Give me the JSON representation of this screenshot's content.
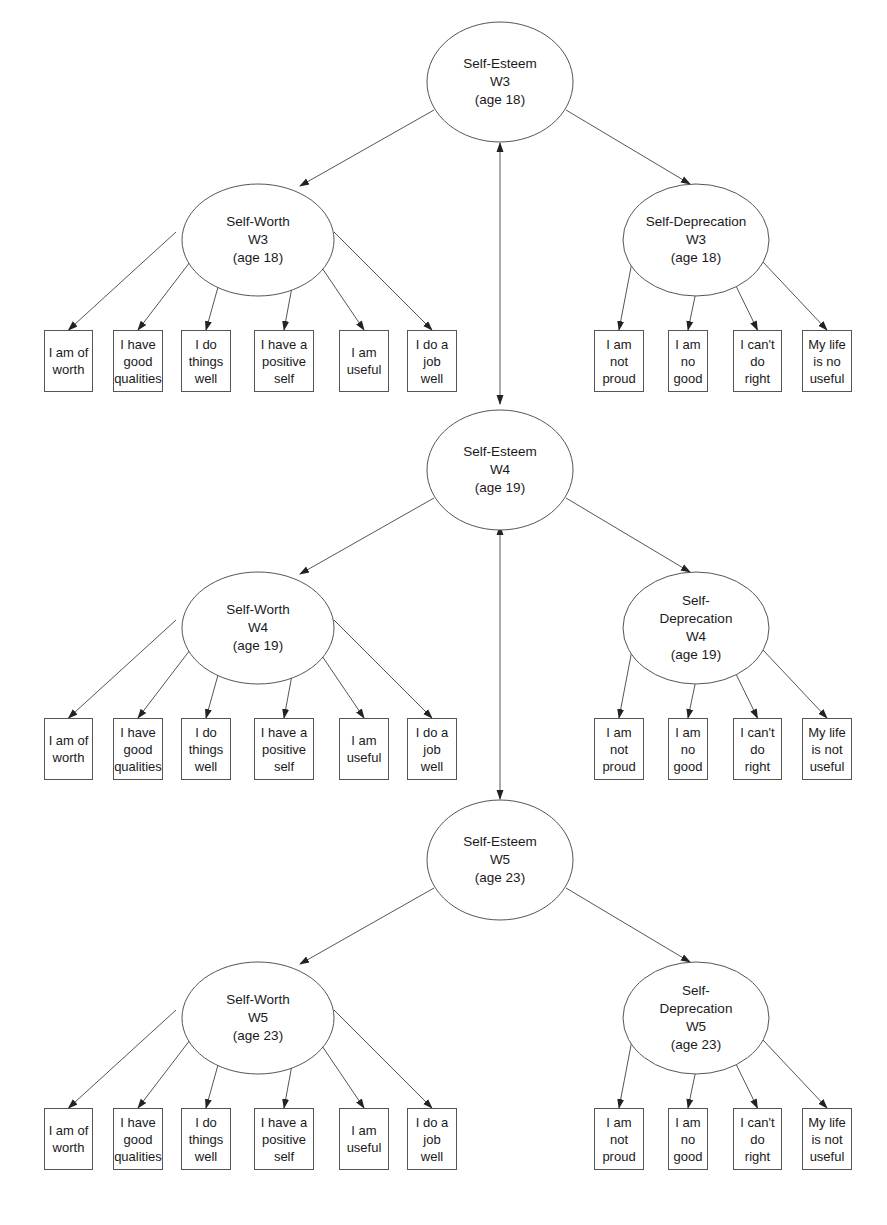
{
  "diagram": {
    "type": "structural-equation-model",
    "waves": [
      {
        "id": "W3",
        "self_esteem": {
          "lines": [
            "Self-Esteem",
            "W3",
            "(age 18)"
          ]
        },
        "self_worth": {
          "lines": [
            "Self-Worth",
            "W3",
            "(age 18)"
          ],
          "indicators": [
            {
              "lines": [
                "I am of",
                "worth"
              ]
            },
            {
              "lines": [
                "I have",
                "good",
                "qualities"
              ]
            },
            {
              "lines": [
                "I do",
                "things",
                "well"
              ]
            },
            {
              "lines": [
                "I have a",
                "positive",
                "self"
              ]
            },
            {
              "lines": [
                "I am",
                "useful"
              ]
            },
            {
              "lines": [
                "I do a",
                "job",
                "well"
              ]
            }
          ]
        },
        "self_deprecation": {
          "lines": [
            "Self-Deprecation",
            "W3",
            "(age 18)"
          ],
          "indicators": [
            {
              "lines": [
                "I am",
                "not",
                "proud"
              ]
            },
            {
              "lines": [
                "I am",
                "no",
                "good"
              ]
            },
            {
              "lines": [
                "I can't",
                "do",
                "right"
              ]
            },
            {
              "lines": [
                "My life",
                "is no",
                "useful"
              ]
            }
          ]
        }
      },
      {
        "id": "W4",
        "self_esteem": {
          "lines": [
            "Self-Esteem",
            "W4",
            "(age 19)"
          ]
        },
        "self_worth": {
          "lines": [
            "Self-Worth",
            "W4",
            "(age 19)"
          ],
          "indicators": [
            {
              "lines": [
                "I am of",
                "worth"
              ]
            },
            {
              "lines": [
                "I have",
                "good",
                "qualities"
              ]
            },
            {
              "lines": [
                "I do",
                "things",
                "well"
              ]
            },
            {
              "lines": [
                "I have a",
                "positive",
                "self"
              ]
            },
            {
              "lines": [
                "I am",
                "useful"
              ]
            },
            {
              "lines": [
                "I do a",
                "job",
                "well"
              ]
            }
          ]
        },
        "self_deprecation": {
          "lines": [
            "Self-",
            "Deprecation",
            "W4",
            "(age 19)"
          ],
          "indicators": [
            {
              "lines": [
                "I am",
                "not",
                "proud"
              ]
            },
            {
              "lines": [
                "I am",
                "no",
                "good"
              ]
            },
            {
              "lines": [
                "I can't",
                "do",
                "right"
              ]
            },
            {
              "lines": [
                "My life",
                "is not",
                "useful"
              ]
            }
          ]
        }
      },
      {
        "id": "W5",
        "self_esteem": {
          "lines": [
            "Self-Esteem",
            "W5",
            "(age 23)"
          ]
        },
        "self_worth": {
          "lines": [
            "Self-Worth",
            "W5",
            "(age 23)"
          ],
          "indicators": [
            {
              "lines": [
                "I am of",
                "worth"
              ]
            },
            {
              "lines": [
                "I have",
                "good",
                "qualities"
              ]
            },
            {
              "lines": [
                "I do",
                "things",
                "well"
              ]
            },
            {
              "lines": [
                "I have a",
                "positive",
                "self"
              ]
            },
            {
              "lines": [
                "I am",
                "useful"
              ]
            },
            {
              "lines": [
                "I do a",
                "job",
                "well"
              ]
            }
          ]
        },
        "self_deprecation": {
          "lines": [
            "Self-",
            "Deprecation",
            "W5",
            "(age 23)"
          ],
          "indicators": [
            {
              "lines": [
                "I am",
                "not",
                "proud"
              ]
            },
            {
              "lines": [
                "I am",
                "no",
                "good"
              ]
            },
            {
              "lines": [
                "I can't",
                "do",
                "right"
              ]
            },
            {
              "lines": [
                "My life",
                "is not",
                "useful"
              ]
            }
          ]
        }
      }
    ],
    "connections": {
      "self_esteem_to_subfactors": "directed",
      "subfactor_to_indicators": "directed",
      "between_waves_self_esteem": "bidirectional"
    },
    "colors": {
      "stroke": "#555555",
      "text": "#1a1a1a",
      "background": "#ffffff"
    }
  }
}
